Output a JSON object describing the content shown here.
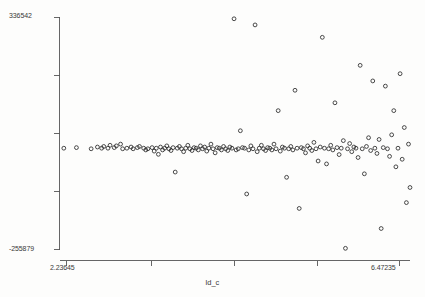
{
  "chart_data": {
    "type": "scatter",
    "title": "",
    "xlabel": "ld_c",
    "ylabel": "",
    "xlim": [
      2.23645,
      6.47235
    ],
    "ylim": [
      -255879,
      336542
    ],
    "xticklabels": [
      "2.23645",
      "6.47235"
    ],
    "yticklabels": [
      "336542",
      "-255879"
    ],
    "xtick_count": 5,
    "ytick_count": 5,
    "grid": false,
    "legend": null,
    "marker": "open-circle",
    "marker_color": "#2b2b2b",
    "points": [
      {
        "x": 2.2886,
        "y": 2960
      },
      {
        "x": 2.441,
        "y": 4440
      },
      {
        "x": 2.6188,
        "y": 1480
      },
      {
        "x": 2.695,
        "y": 5920
      },
      {
        "x": 2.7458,
        "y": 2960
      },
      {
        "x": 2.7712,
        "y": 7400
      },
      {
        "x": 2.822,
        "y": 2960
      },
      {
        "x": 2.8474,
        "y": 10360
      },
      {
        "x": 2.8982,
        "y": 4440
      },
      {
        "x": 2.9236,
        "y": 8880
      },
      {
        "x": 2.9744,
        "y": 13320
      },
      {
        "x": 2.9998,
        "y": 1480
      },
      {
        "x": 3.0506,
        "y": 2960
      },
      {
        "x": 3.1014,
        "y": 5920
      },
      {
        "x": 3.1268,
        "y": 1480
      },
      {
        "x": 3.1776,
        "y": 4440
      },
      {
        "x": 3.203,
        "y": 7400
      },
      {
        "x": 3.2538,
        "y": 2960
      },
      {
        "x": 3.2792,
        "y": -1480
      },
      {
        "x": 3.3046,
        "y": 1480
      },
      {
        "x": 3.3554,
        "y": 4440
      },
      {
        "x": 3.3808,
        "y": -4440
      },
      {
        "x": 3.4062,
        "y": 2960
      },
      {
        "x": 3.4316,
        "y": -12580
      },
      {
        "x": 3.457,
        "y": 5920
      },
      {
        "x": 3.4824,
        "y": -1480
      },
      {
        "x": 3.5078,
        "y": 2960
      },
      {
        "x": 3.5332,
        "y": 8880
      },
      {
        "x": 3.5586,
        "y": 1480
      },
      {
        "x": 3.584,
        "y": -2960
      },
      {
        "x": 3.6094,
        "y": 4440
      },
      {
        "x": 3.6348,
        "y": -57720
      },
      {
        "x": 3.6602,
        "y": 2960
      },
      {
        "x": 3.6856,
        "y": 7400
      },
      {
        "x": 3.711,
        "y": 1480
      },
      {
        "x": 3.7364,
        "y": -5920
      },
      {
        "x": 3.7618,
        "y": 2960
      },
      {
        "x": 3.7872,
        "y": 10360
      },
      {
        "x": 3.8126,
        "y": 1480
      },
      {
        "x": 3.838,
        "y": -2960
      },
      {
        "x": 3.8634,
        "y": 4440
      },
      {
        "x": 3.8888,
        "y": 2960
      },
      {
        "x": 3.9142,
        "y": -1480
      },
      {
        "x": 3.9396,
        "y": 8880
      },
      {
        "x": 3.965,
        "y": 1480
      },
      {
        "x": 3.9904,
        "y": 5920
      },
      {
        "x": 4.0158,
        "y": -4440
      },
      {
        "x": 4.0412,
        "y": 2960
      },
      {
        "x": 4.0666,
        "y": 13320
      },
      {
        "x": 4.092,
        "y": 1480
      },
      {
        "x": 4.1174,
        "y": -8880
      },
      {
        "x": 4.1428,
        "y": 4440
      },
      {
        "x": 4.1682,
        "y": 2960
      },
      {
        "x": 4.1936,
        "y": -1480
      },
      {
        "x": 4.219,
        "y": 7400
      },
      {
        "x": 4.2444,
        "y": 1480
      },
      {
        "x": 4.2698,
        "y": -2960
      },
      {
        "x": 4.2952,
        "y": 5920
      },
      {
        "x": 4.3206,
        "y": 2960
      },
      {
        "x": 4.346,
        "y": 332000
      },
      {
        "x": 4.3714,
        "y": -1480
      },
      {
        "x": 4.3968,
        "y": 1480
      },
      {
        "x": 4.4222,
        "y": 47360
      },
      {
        "x": 4.4476,
        "y": 4440
      },
      {
        "x": 4.473,
        "y": 2960
      },
      {
        "x": 4.4984,
        "y": -113440
      },
      {
        "x": 4.5238,
        "y": -1480
      },
      {
        "x": 4.5492,
        "y": 8880
      },
      {
        "x": 4.5746,
        "y": 1480
      },
      {
        "x": 4.6,
        "y": 316400
      },
      {
        "x": 4.6254,
        "y": -5920
      },
      {
        "x": 4.6508,
        "y": 2960
      },
      {
        "x": 4.6762,
        "y": 10360
      },
      {
        "x": 4.7016,
        "y": 1480
      },
      {
        "x": 4.727,
        "y": -2960
      },
      {
        "x": 4.7524,
        "y": 4440
      },
      {
        "x": 4.7778,
        "y": 2960
      },
      {
        "x": 4.8032,
        "y": -1480
      },
      {
        "x": 4.8286,
        "y": 13320
      },
      {
        "x": 4.854,
        "y": 1480
      },
      {
        "x": 4.8794,
        "y": 98420
      },
      {
        "x": 4.9048,
        "y": -4440
      },
      {
        "x": 4.9302,
        "y": 5920
      },
      {
        "x": 4.9556,
        "y": 2960
      },
      {
        "x": 4.981,
        "y": -71040
      },
      {
        "x": 5.0064,
        "y": 1480
      },
      {
        "x": 5.0318,
        "y": 7400
      },
      {
        "x": 5.0572,
        "y": -1480
      },
      {
        "x": 5.0826,
        "y": 150220
      },
      {
        "x": 5.108,
        "y": 2960
      },
      {
        "x": 5.1334,
        "y": -150220
      },
      {
        "x": 5.1588,
        "y": 4440
      },
      {
        "x": 5.1842,
        "y": 1480
      },
      {
        "x": 5.2096,
        "y": -8880
      },
      {
        "x": 5.235,
        "y": 8880
      },
      {
        "x": 5.2604,
        "y": 2960
      },
      {
        "x": 5.2858,
        "y": -2960
      },
      {
        "x": 5.3112,
        "y": 17760
      },
      {
        "x": 5.3366,
        "y": 1480
      },
      {
        "x": 5.362,
        "y": -29600
      },
      {
        "x": 5.3874,
        "y": 5920
      },
      {
        "x": 5.4128,
        "y": 284880
      },
      {
        "x": 5.4382,
        "y": 2960
      },
      {
        "x": 5.4636,
        "y": -37000
      },
      {
        "x": 5.489,
        "y": 1480
      },
      {
        "x": 5.5144,
        "y": 10360
      },
      {
        "x": 5.5398,
        "y": -1480
      },
      {
        "x": 5.5652,
        "y": 118400
      },
      {
        "x": 5.5906,
        "y": 4440
      },
      {
        "x": 5.616,
        "y": -13320
      },
      {
        "x": 5.6414,
        "y": 2960
      },
      {
        "x": 5.6668,
        "y": 22200
      },
      {
        "x": 5.6922,
        "y": -251600
      },
      {
        "x": 5.7176,
        "y": 1480
      },
      {
        "x": 5.743,
        "y": 14800
      },
      {
        "x": 5.7684,
        "y": -5920
      },
      {
        "x": 5.7938,
        "y": 5920
      },
      {
        "x": 5.8192,
        "y": 2960
      },
      {
        "x": 5.8446,
        "y": -20720
      },
      {
        "x": 5.87,
        "y": 213600
      },
      {
        "x": 5.8954,
        "y": 1480
      },
      {
        "x": 5.9208,
        "y": -62160
      },
      {
        "x": 5.9462,
        "y": 7400
      },
      {
        "x": 5.9716,
        "y": 29600
      },
      {
        "x": 5.997,
        "y": -2960
      },
      {
        "x": 6.0224,
        "y": 174000
      },
      {
        "x": 6.0478,
        "y": 2960
      },
      {
        "x": 6.0732,
        "y": -10360
      },
      {
        "x": 6.0986,
        "y": 25160
      },
      {
        "x": 6.124,
        "y": -201240
      },
      {
        "x": 6.1494,
        "y": 4440
      },
      {
        "x": 6.1748,
        "y": 160800
      },
      {
        "x": 6.2002,
        "y": 1480
      },
      {
        "x": 6.2256,
        "y": -17760
      },
      {
        "x": 6.251,
        "y": 37000
      },
      {
        "x": 6.2764,
        "y": 98420
      },
      {
        "x": 6.3018,
        "y": -44400
      },
      {
        "x": 6.3272,
        "y": 2960
      },
      {
        "x": 6.3526,
        "y": 192400
      },
      {
        "x": 6.378,
        "y": -25160
      },
      {
        "x": 6.4034,
        "y": 55500
      },
      {
        "x": 6.4288,
        "y": -135420
      },
      {
        "x": 6.4542,
        "y": 13320
      },
      {
        "x": 6.4723,
        "y": -96940
      }
    ]
  },
  "axis": {
    "y_top_label": "336542",
    "y_bottom_label": "-255879",
    "x_left_label": "2.23645",
    "x_right_label": "6.47235",
    "x_title": "ld_c"
  }
}
